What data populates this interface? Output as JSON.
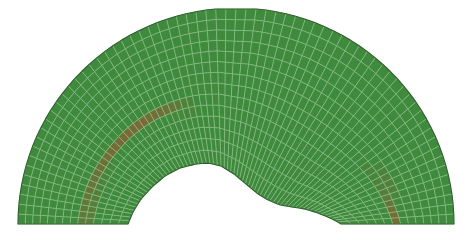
{
  "view": {
    "title": "Finite element mesh of arched half-annulus domain",
    "background_color": "#ffffff",
    "width": 472,
    "height": 240
  },
  "legend": {
    "element_fill": "#3f8a3c",
    "element_edge": "#8ec08b",
    "outline_color": "#2d5e2b",
    "band_color": "#7a6a36",
    "band_label": "damage band"
  },
  "chart_data": {
    "type": "mesh",
    "xlabel": "",
    "ylabel": "",
    "xlim": [
      0,
      472
    ],
    "ylim": [
      0,
      240
    ],
    "grid": true,
    "legend_position": "none",
    "geometry": {
      "shape": "half-annulus arch with undulating inner boundary",
      "center_x": 236,
      "center_y": 224,
      "outer_radius_x": 218,
      "outer_radius_y": 216,
      "outer_top_flat_y": 9,
      "base_y": 224,
      "left_outer_x": 18,
      "right_outer_x": 455,
      "inner_left_foot_x": 128,
      "inner_right_foot_x": 341,
      "inner_profile_points": [
        [
          128,
          224
        ],
        [
          133,
          212
        ],
        [
          141,
          199
        ],
        [
          152,
          187
        ],
        [
          165,
          176
        ],
        [
          180,
          168
        ],
        [
          196,
          164
        ],
        [
          208,
          163
        ],
        [
          221,
          166
        ],
        [
          234,
          174
        ],
        [
          246,
          184
        ],
        [
          258,
          194
        ],
        [
          268,
          200
        ],
        [
          280,
          205
        ],
        [
          292,
          207
        ],
        [
          305,
          209
        ],
        [
          318,
          213
        ],
        [
          330,
          218
        ],
        [
          338,
          222
        ],
        [
          341,
          224
        ]
      ]
    },
    "mesh": {
      "radial_divisions": 14,
      "circumferential_divisions": 68,
      "element_type": "quadrilateral",
      "element_count": 952
    },
    "bands": [
      {
        "name": "left-damage-band",
        "color": "#7a6a36",
        "path_points": [
          [
            85,
            224
          ],
          [
            88,
            206
          ],
          [
            93,
            188
          ],
          [
            101,
            170
          ],
          [
            112,
            152
          ],
          [
            126,
            136
          ],
          [
            143,
            122
          ],
          [
            162,
            113
          ],
          [
            180,
            108
          ],
          [
            192,
            107
          ]
        ],
        "width_px": 6
      },
      {
        "name": "right-damage-band",
        "color": "#7a6a36",
        "path_points": [
          [
            396,
            224
          ],
          [
            394,
            212
          ],
          [
            391,
            200
          ],
          [
            387,
            189
          ],
          [
            382,
            179
          ],
          [
            376,
            171
          ],
          [
            370,
            166
          ]
        ],
        "width_px": 5
      }
    ]
  }
}
